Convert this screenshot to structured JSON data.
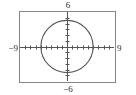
{
  "figure": {
    "kind": "graphing-calculator-viewing-window",
    "background_color": "#ffffff"
  },
  "frame": {
    "border_color": "#868686"
  },
  "labels": {
    "ymax": "6",
    "ymin": "−6",
    "xmin": "−9",
    "xmax": "9"
  },
  "chart_data": {
    "type": "line",
    "title": "",
    "subtitle": "",
    "xlabel": "",
    "ylabel": "",
    "xlim": [
      -9,
      9
    ],
    "ylim": [
      -6,
      6
    ],
    "grid": false,
    "legend": null,
    "axes": {
      "x_axis_color": "#555555",
      "y_axis_color": "#555555",
      "x_tick_spacing": 1,
      "y_tick_spacing": 1,
      "x_tick_values": [
        -8,
        -7,
        -6,
        -5,
        -4,
        -3,
        -2,
        -1,
        1,
        2,
        3,
        4,
        5,
        6,
        7,
        8
      ],
      "y_tick_values": [
        -5,
        -4,
        -3,
        -2,
        -1,
        1,
        2,
        3,
        4,
        5
      ],
      "tick_labels_shown": false
    },
    "annotations": [
      {
        "name": "ymax-label",
        "text": "6",
        "position": "top-outside"
      },
      {
        "name": "ymin-label",
        "text": "−6",
        "position": "bottom-outside"
      },
      {
        "name": "xmin-label",
        "text": "−9",
        "position": "left-outside"
      },
      {
        "name": "xmax-label",
        "text": "9",
        "position": "right-outside"
      }
    ],
    "series": [
      {
        "name": "circle",
        "type": "implicit-curve",
        "equation": "x^2 + y^2 = 25",
        "shape": "circle",
        "center": [
          0,
          0
        ],
        "radius": 5,
        "color": "#555555"
      }
    ]
  }
}
